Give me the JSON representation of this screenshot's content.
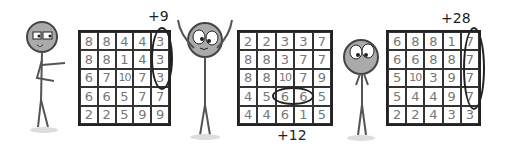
{
  "panels": [
    {
      "annotation": "+9",
      "grid": [
        [
          8,
          8,
          4,
          4,
          3
        ],
        [
          8,
          8,
          1,
          4,
          3
        ],
        [
          6,
          7,
          10,
          7,
          3
        ],
        [
          6,
          6,
          5,
          7,
          7
        ],
        [
          2,
          2,
          5,
          9,
          9
        ]
      ],
      "highlight": "column 5, rows 1-3"
    },
    {
      "annotation": "+12",
      "grid": [
        [
          2,
          2,
          3,
          3,
          7
        ],
        [
          8,
          8,
          3,
          7,
          7
        ],
        [
          8,
          8,
          10,
          7,
          9
        ],
        [
          4,
          5,
          6,
          6,
          5
        ],
        [
          4,
          4,
          6,
          1,
          5
        ]
      ],
      "highlight": "row 4, columns 3-4"
    },
    {
      "annotation": "+28",
      "grid": [
        [
          6,
          8,
          8,
          1,
          7
        ],
        [
          6,
          6,
          8,
          8,
          7
        ],
        [
          5,
          10,
          3,
          9,
          7
        ],
        [
          5,
          4,
          4,
          9,
          7
        ],
        [
          2,
          2,
          4,
          3,
          3
        ]
      ],
      "highlight": "column 5, rows 1-4"
    }
  ],
  "characters": [
    "stick-figure-smug",
    "stick-figure-cheering",
    "stick-figure-nervous"
  ]
}
